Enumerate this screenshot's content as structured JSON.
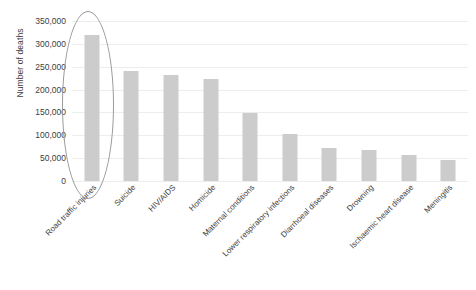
{
  "chart_data": {
    "type": "bar",
    "title": "",
    "xlabel": "",
    "ylabel": "Number of deaths",
    "categories": [
      "Road traffic injuries",
      "Suicide",
      "HIV/AIDS",
      "Homicide",
      "Maternal conditions",
      "Lower respiratory infections",
      "Diarrhoeal diseases",
      "Drowning",
      "Ischaemic heart disease",
      "Meningitis"
    ],
    "values": [
      320000,
      240000,
      232000,
      224000,
      148000,
      103000,
      73000,
      68000,
      58000,
      46000
    ],
    "ylim": [
      0,
      350000
    ],
    "ytick_values": [
      0,
      50000,
      100000,
      150000,
      200000,
      250000,
      300000,
      350000
    ],
    "ytick_labels": [
      "0",
      "50,000",
      "100,000",
      "150,000",
      "200,000",
      "250,000",
      "300,000",
      "350,000"
    ],
    "grid": true,
    "legend": false,
    "bar_color": "#cccccc",
    "grid_color": "#ededed",
    "background": "#ffffff",
    "annotations": [
      {
        "name": "highlight-ellipse",
        "shape": "ellipse",
        "target_category": "Road traffic injuries",
        "stroke": "#9a9a9a"
      }
    ]
  }
}
